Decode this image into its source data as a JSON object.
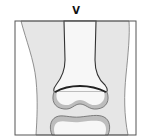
{
  "figure": {
    "stage_label": "V"
  },
  "colors": {
    "frame": "#555555",
    "soft_tissue": "#e6e6e6",
    "bone_marrow": "#f7f7f7",
    "cartilage": "#bdbdbd",
    "outline": "#333333",
    "growth_plate": "#222222",
    "background": "#ffffff"
  }
}
